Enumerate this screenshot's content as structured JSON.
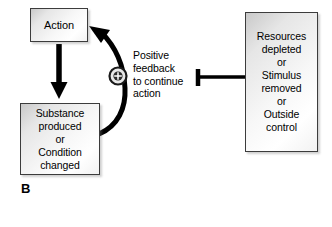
{
  "diagram": {
    "panel_letter": "B",
    "boxes": {
      "action": {
        "label": "Action"
      },
      "substance": {
        "label": "Substance\nproduced\nor\nCondition\nchanged"
      },
      "resources": {
        "label": "Resources\ndepleted\nor\nStimulus\nremoved\nor\nOutside\ncontrol"
      }
    },
    "annotations": {
      "feedback_text": "Positive\nfeedback\nto continue\naction",
      "feedback_node_symbol": "+"
    },
    "connectors": {
      "action_to_substance": "down-arrow",
      "substance_to_action": "curved-feedback-arrow",
      "resources_to_feedback": "inhibition-t-bar"
    },
    "colors": {
      "stroke": "#000000",
      "box_border": "#3c3c3c",
      "box_fill_light": "#ffffff",
      "box_fill_shade": "#c9c9c9",
      "background": "#ffffff"
    }
  }
}
